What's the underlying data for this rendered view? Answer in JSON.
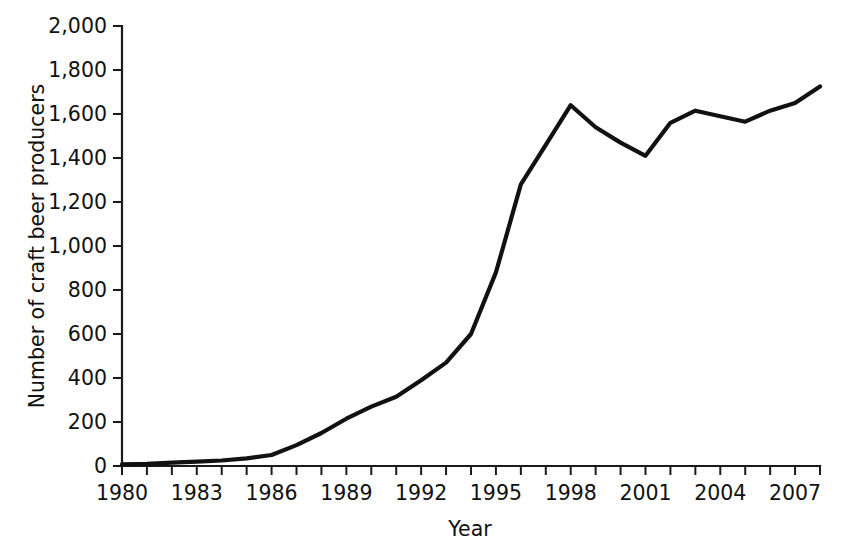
{
  "chart_data": {
    "type": "line",
    "title": "",
    "subtitle": "",
    "xlabel": "Year",
    "ylabel": "Number of craft beer producers",
    "xlim": [
      1980,
      2008
    ],
    "ylim": [
      0,
      2000
    ],
    "grid": false,
    "legend": false,
    "legend_position": "none",
    "x_tick_interval": 1,
    "x_label_interval": 3,
    "y_tick_interval": 200,
    "x_tick_values": [
      1980,
      1981,
      1982,
      1983,
      1984,
      1985,
      1986,
      1987,
      1988,
      1989,
      1990,
      1991,
      1992,
      1993,
      1994,
      1995,
      1996,
      1997,
      1998,
      1999,
      2000,
      2001,
      2002,
      2003,
      2004,
      2005,
      2006,
      2007,
      2008
    ],
    "x_tick_labels": [
      "1980",
      "",
      "",
      "1983",
      "",
      "",
      "1986",
      "",
      "",
      "1989",
      "",
      "",
      "1992",
      "",
      "",
      "1995",
      "",
      "",
      "1998",
      "",
      "",
      "2001",
      "",
      "",
      "2004",
      "",
      "",
      "2007",
      ""
    ],
    "x_labels_shown": [
      "1980",
      "1983",
      "1986",
      "1989",
      "1992",
      "1995",
      "1998",
      "2001",
      "2004",
      "2007"
    ],
    "y_tick_values": [
      0,
      200,
      400,
      600,
      800,
      1000,
      1200,
      1400,
      1600,
      1800,
      2000
    ],
    "y_tick_labels": [
      "0",
      "200",
      "400",
      "600",
      "800",
      "1,000",
      "1,200",
      "1,400",
      "1,600",
      "1,800",
      "2,000"
    ],
    "line_color": "#111111",
    "x": [
      1980,
      1981,
      1982,
      1983,
      1984,
      1985,
      1986,
      1987,
      1988,
      1989,
      1990,
      1991,
      1992,
      1993,
      1994,
      1995,
      1996,
      1997,
      1998,
      1999,
      2000,
      2001,
      2002,
      2003,
      2004,
      2005,
      2006,
      2007,
      2008
    ],
    "values": [
      8,
      10,
      15,
      20,
      25,
      35,
      50,
      95,
      150,
      215,
      270,
      315,
      390,
      470,
      600,
      880,
      1280,
      1460,
      1640,
      1540,
      1470,
      1410,
      1560,
      1615,
      1590,
      1565,
      1615,
      1650,
      1725
    ],
    "series": [
      {
        "name": "Number of craft beer producers",
        "values": [
          8,
          10,
          15,
          20,
          25,
          35,
          50,
          95,
          150,
          215,
          270,
          315,
          390,
          470,
          600,
          880,
          1280,
          1460,
          1640,
          1540,
          1470,
          1410,
          1560,
          1615,
          1590,
          1565,
          1615,
          1650,
          1725
        ]
      }
    ]
  },
  "axes": {
    "y_title": "Number of craft beer producers",
    "x_title": "Year"
  }
}
